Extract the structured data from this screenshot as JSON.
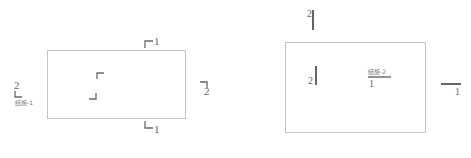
{
  "diagram": {
    "type": "section-cut-symbols",
    "colors": {
      "line": "#b8b8b8",
      "marker": "#6a6a6a",
      "thick": "#555555",
      "text": "#666666"
    },
    "left_figure": {
      "top_marker_label": "1",
      "bottom_marker_label": "1",
      "right_marker_label": "2",
      "left_marker_label": "2",
      "left_marker_ref": "结施-1"
    },
    "right_figure": {
      "top_marker_label": "2",
      "inner_marker_label": "2",
      "index_ref": "结施-2",
      "index_number": "1",
      "right_marker_label": "1"
    }
  }
}
